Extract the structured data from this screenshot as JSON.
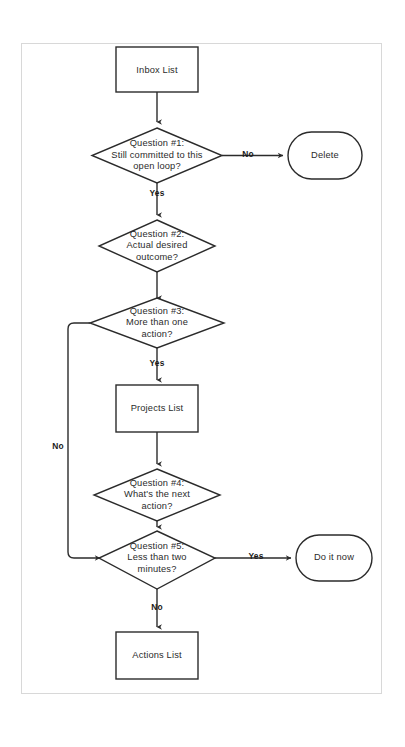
{
  "diagram": {
    "background_color": "#ffffff",
    "frame_color": "#d8d8d8",
    "line_color": "#2b2b2b",
    "text_color": "#2b2b2b",
    "nodes": {
      "inbox_list": {
        "label": "Inbox List",
        "shape": "rectangle"
      },
      "question_1": {
        "line1": "Question #1:",
        "line2": "Still committed to this",
        "line3": "open loop?",
        "shape": "diamond"
      },
      "delete": {
        "label": "Delete",
        "shape": "stadium"
      },
      "question_2": {
        "line1": "Question #2:",
        "line2": "Actual desired",
        "line3": "outcome?",
        "shape": "diamond"
      },
      "question_3": {
        "line1": "Question #3:",
        "line2": "More than one",
        "line3": "action?",
        "shape": "diamond"
      },
      "projects_list": {
        "label": "Projects List",
        "shape": "rectangle"
      },
      "question_4": {
        "line1": "Question #4:",
        "line2": "What's the next",
        "line3": "action?",
        "shape": "diamond"
      },
      "question_5": {
        "line1": "Question #5:",
        "line2": "Less than two",
        "line3": "minutes?",
        "shape": "diamond"
      },
      "do_it_now": {
        "label": "Do it now",
        "shape": "stadium"
      },
      "actions_list": {
        "label": "Actions List",
        "shape": "rectangle"
      }
    },
    "edge_labels": {
      "q1_no": "No",
      "q1_yes": "Yes",
      "q3_yes": "Yes",
      "q3_no": "No",
      "q5_yes": "Yes",
      "q5_no": "No"
    }
  }
}
